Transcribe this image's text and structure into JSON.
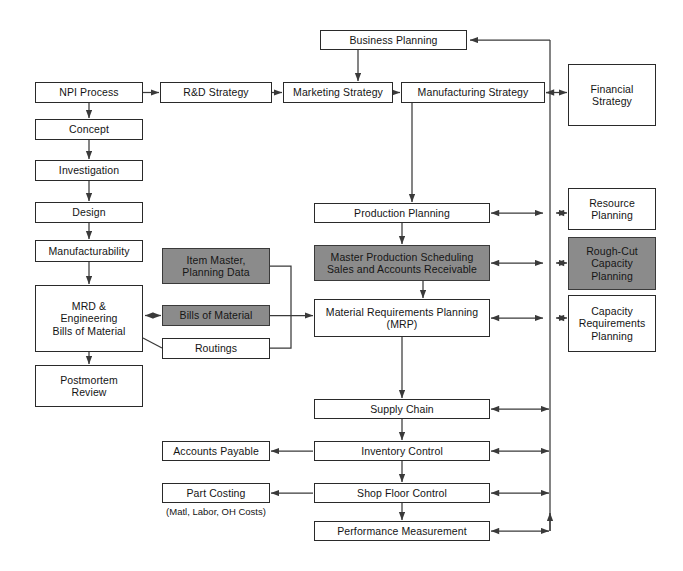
{
  "diagram": {
    "colors": {
      "box_fill": "#ffffff",
      "box_stroke": "#2a2a2a",
      "highlight_fill": "#8b8b8b",
      "arrow": "#3a3a3a",
      "text": "#141414",
      "background": "#ffffff"
    },
    "nodes": [
      {
        "id": "npi_process",
        "label": "NPI Process",
        "fill": "white",
        "x": 35,
        "y": 82,
        "w": 108,
        "h": 21
      },
      {
        "id": "concept",
        "label": "Concept",
        "fill": "white",
        "x": 35,
        "y": 119,
        "w": 108,
        "h": 21
      },
      {
        "id": "investigation",
        "label": "Investigation",
        "fill": "white",
        "x": 35,
        "y": 160,
        "w": 108,
        "h": 21
      },
      {
        "id": "design",
        "label": "Design",
        "fill": "white",
        "x": 35,
        "y": 202,
        "w": 108,
        "h": 21
      },
      {
        "id": "manufacturability",
        "label": "Manufacturability",
        "fill": "white",
        "x": 35,
        "y": 240,
        "w": 108,
        "h": 22
      },
      {
        "id": "mrd_eng_bom",
        "label": "MRD &\nEngineering\nBills of Material",
        "fill": "white",
        "x": 35,
        "y": 285,
        "w": 108,
        "h": 67
      },
      {
        "id": "postmortem_review",
        "label": "Postmortem\nReview",
        "fill": "white",
        "x": 35,
        "y": 365,
        "w": 108,
        "h": 42
      },
      {
        "id": "rd_strategy",
        "label": "R&D Strategy",
        "fill": "white",
        "x": 160,
        "y": 82,
        "w": 112,
        "h": 21
      },
      {
        "id": "marketing_strategy",
        "label": "Marketing Strategy",
        "fill": "white",
        "x": 283,
        "y": 82,
        "w": 110,
        "h": 21
      },
      {
        "id": "manufacturing_strategy",
        "label": "Manufacturing Strategy",
        "fill": "white",
        "x": 401,
        "y": 82,
        "w": 144,
        "h": 21
      },
      {
        "id": "business_planning",
        "label": "Business Planning",
        "fill": "white",
        "x": 320,
        "y": 30,
        "w": 147,
        "h": 20
      },
      {
        "id": "financial_strategy",
        "label": "Financial\nStrategy",
        "fill": "white",
        "x": 568,
        "y": 64,
        "w": 88,
        "h": 62
      },
      {
        "id": "production_planning",
        "label": "Production Planning",
        "fill": "white",
        "x": 314,
        "y": 203,
        "w": 176,
        "h": 20
      },
      {
        "id": "resource_planning",
        "label": "Resource\nPlanning",
        "fill": "white",
        "x": 568,
        "y": 188,
        "w": 88,
        "h": 42
      },
      {
        "id": "item_master",
        "label": "Item Master,\nPlanning Data",
        "fill": "gray",
        "x": 162,
        "y": 248,
        "w": 108,
        "h": 36
      },
      {
        "id": "mps_sales_ar",
        "label": "Master Production Scheduling\nSales and Accounts Receivable",
        "fill": "gray",
        "x": 314,
        "y": 245,
        "w": 176,
        "h": 36
      },
      {
        "id": "rough_cut_capacity",
        "label": "Rough-Cut\nCapacity\nPlanning",
        "fill": "gray",
        "x": 568,
        "y": 237,
        "w": 88,
        "h": 53
      },
      {
        "id": "bills_of_material",
        "label": "Bills of Material",
        "fill": "gray",
        "x": 162,
        "y": 305,
        "w": 108,
        "h": 21
      },
      {
        "id": "material_req_planning",
        "label": "Material Requirements Planning\n(MRP)",
        "fill": "white",
        "x": 314,
        "y": 299,
        "w": 176,
        "h": 38
      },
      {
        "id": "capacity_req_planning",
        "label": "Capacity\nRequirements\nPlanning",
        "fill": "white",
        "x": 568,
        "y": 295,
        "w": 88,
        "h": 57
      },
      {
        "id": "routings",
        "label": "Routings",
        "fill": "white",
        "x": 162,
        "y": 338,
        "w": 108,
        "h": 21
      },
      {
        "id": "supply_chain",
        "label": "Supply Chain",
        "fill": "white",
        "x": 314,
        "y": 399,
        "w": 176,
        "h": 20
      },
      {
        "id": "accounts_payable",
        "label": "Accounts Payable",
        "fill": "white",
        "x": 162,
        "y": 441,
        "w": 108,
        "h": 20
      },
      {
        "id": "inventory_control",
        "label": "Inventory Control",
        "fill": "white",
        "x": 314,
        "y": 441,
        "w": 176,
        "h": 20
      },
      {
        "id": "part_costing",
        "label": "Part Costing",
        "fill": "white",
        "x": 162,
        "y": 483,
        "w": 108,
        "h": 20
      },
      {
        "id": "shop_floor_control",
        "label": "Shop Floor Control",
        "fill": "white",
        "x": 314,
        "y": 483,
        "w": 176,
        "h": 20
      },
      {
        "id": "performance_measurement",
        "label": "Performance Measurement",
        "fill": "white",
        "x": 314,
        "y": 521,
        "w": 176,
        "h": 20
      }
    ],
    "free_text": [
      {
        "id": "part_costing_note",
        "label": "(Matl, Labor, OH Costs)",
        "x": 162,
        "y": 506,
        "w": 108
      }
    ],
    "connectors": [
      {
        "id": "npi-to-concept",
        "from": "npi_process",
        "to": "concept"
      },
      {
        "id": "concept-to-investigation",
        "from": "concept",
        "to": "investigation"
      },
      {
        "id": "investigation-to-design",
        "from": "investigation",
        "to": "design"
      },
      {
        "id": "design-to-manufacturability",
        "from": "design",
        "to": "manufacturability"
      },
      {
        "id": "manufacturability-to-mrd",
        "from": "manufacturability",
        "to": "mrd_eng_bom"
      },
      {
        "id": "mrd-to-postmortem",
        "from": "mrd_eng_bom",
        "to": "postmortem_review"
      },
      {
        "id": "npi-to-rd-strategy",
        "from": "npi_process",
        "to": "rd_strategy"
      },
      {
        "id": "rd-to-marketing-strategy",
        "from": "rd_strategy",
        "to": "marketing_strategy"
      },
      {
        "id": "marketing-to-manufacturing",
        "from": "marketing_strategy",
        "to": "manufacturing_strategy"
      },
      {
        "id": "business-planning-to-marketing",
        "from": "business_planning",
        "to": "marketing_strategy"
      },
      {
        "id": "manufacturing-to-financial",
        "from": "manufacturing_strategy",
        "to": "financial_strategy",
        "bidirectional": true
      },
      {
        "id": "manufacturing-to-production",
        "from": "manufacturing_strategy",
        "to": "production_planning"
      },
      {
        "id": "production-to-mps",
        "from": "production_planning",
        "to": "mps_sales_ar"
      },
      {
        "id": "mps-to-mrp",
        "from": "mps_sales_ar",
        "to": "material_req_planning"
      },
      {
        "id": "mrp-to-supply-chain",
        "from": "material_req_planning",
        "to": "supply_chain"
      },
      {
        "id": "supply-chain-to-inventory",
        "from": "supply_chain",
        "to": "inventory_control"
      },
      {
        "id": "inventory-to-shop-floor",
        "from": "inventory_control",
        "to": "shop_floor_control"
      },
      {
        "id": "shop-floor-to-performance",
        "from": "shop_floor_control",
        "to": "performance_measurement"
      },
      {
        "id": "inventory-to-accounts-payable",
        "from": "inventory_control",
        "to": "accounts_payable"
      },
      {
        "id": "shop-floor-to-part-costing",
        "from": "shop_floor_control",
        "to": "part_costing"
      },
      {
        "id": "mrd-to-bills-of-material",
        "from": "mrd_eng_bom",
        "to": "bills_of_material",
        "bidirectional": true
      },
      {
        "id": "master-data-to-mrp",
        "from": "item_master",
        "to": "material_req_planning"
      },
      {
        "id": "production-to-resource-planning",
        "from": "production_planning",
        "to": "resource_planning",
        "bidirectional": true
      },
      {
        "id": "mps-to-rough-cut-capacity",
        "from": "mps_sales_ar",
        "to": "rough_cut_capacity",
        "bidirectional": true
      },
      {
        "id": "mrp-to-capacity-requirements",
        "from": "material_req_planning",
        "to": "capacity_req_planning",
        "bidirectional": true
      },
      {
        "id": "feedback-bus-to-business-planning",
        "from": "performance_measurement",
        "to": "business_planning"
      }
    ]
  }
}
